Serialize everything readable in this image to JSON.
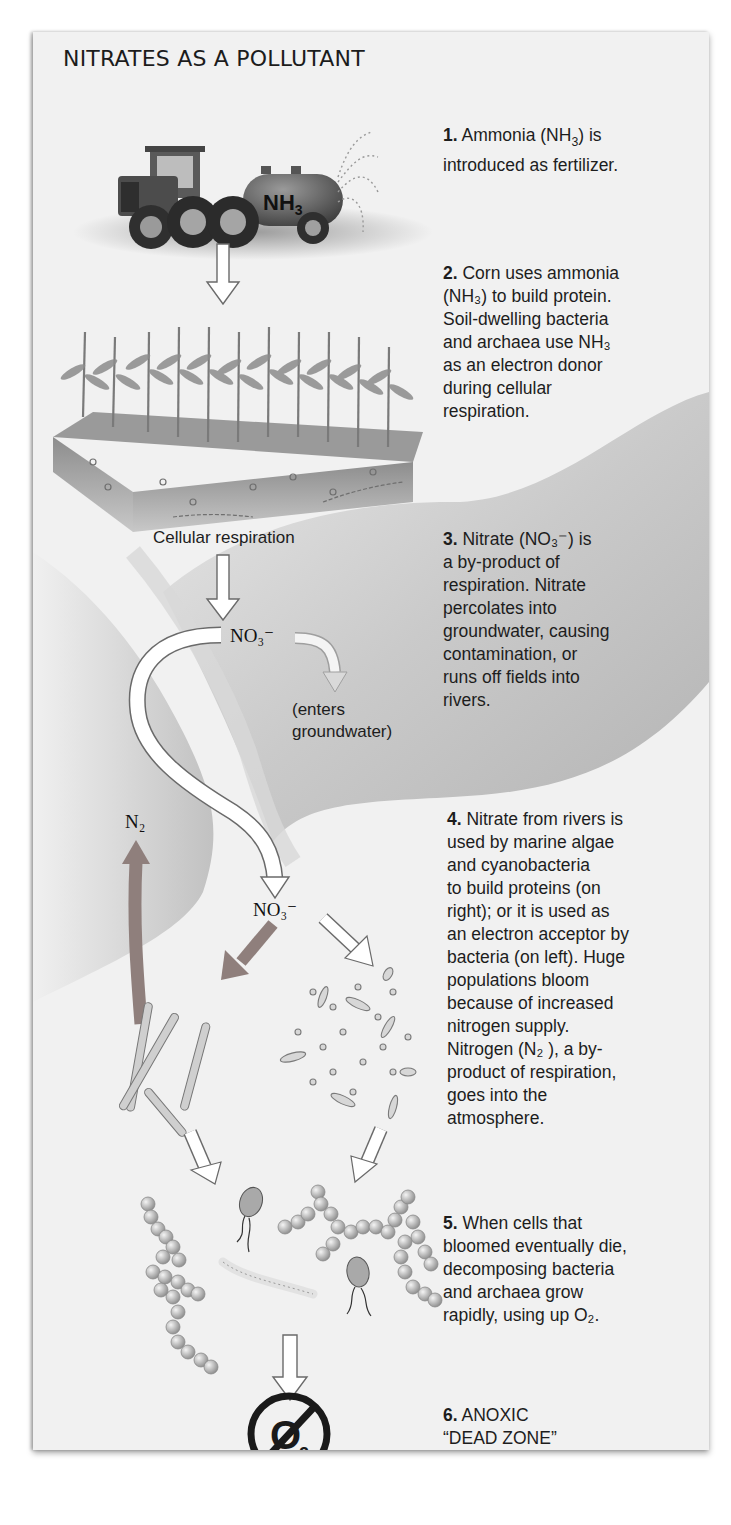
{
  "figure": {
    "title": "NITRATES AS A POLLUTANT",
    "colors": {
      "panel_bg": "#f1f1f1",
      "river_shade": "#b9b9b9",
      "white_arrow": "#ffffff",
      "arrow_outline": "#6a6a6a",
      "n2_arrow": "#8f7f7c",
      "no_o2_symbol": "#1a1a1a"
    }
  },
  "steps": [
    {
      "number": "1.",
      "parts": [
        "Ammonia (NH",
        "3",
        ") is",
        "introduced as fertilizer."
      ]
    },
    {
      "number": "2.",
      "lines": [
        "Corn uses ammonia",
        "(NH₃) to build protein.",
        "Soil-dwelling bacteria",
        "and archaea use NH₃",
        "as an electron donor",
        "during cellular",
        "respiration."
      ]
    },
    {
      "number": "3.",
      "lines": [
        "Nitrate (NO₃⁻) is",
        "a by-product of",
        "respiration. Nitrate",
        "percolates into",
        "groundwater, causing",
        "contamination, or",
        "runs off fields into",
        "rivers."
      ]
    },
    {
      "number": "4.",
      "lines": [
        "Nitrate from rivers is",
        "used by marine algae",
        "and cyanobacteria",
        "to build proteins (on",
        "right); or it is used as",
        "an electron acceptor by",
        "bacteria (on left). Huge",
        "populations bloom",
        "because of increased",
        "nitrogen supply.",
        "Nitrogen (N₂ ), a by-",
        "product of respiration,",
        "goes into the",
        "atmosphere."
      ]
    },
    {
      "number": "5.",
      "lines": [
        "When cells that",
        "bloomed eventually die,",
        "decomposing bacteria",
        "and archaea grow",
        "rapidly, using up O₂."
      ]
    },
    {
      "number": "6.",
      "lines": [
        "ANOXIC",
        "“DEAD ZONE”"
      ]
    }
  ],
  "labels": {
    "tank": "NH₃",
    "cellular_respiration": "Cellular respiration",
    "nitrate_top": "NO₃⁻",
    "enters_groundwater_1": "(enters",
    "enters_groundwater_2": "groundwater)",
    "n2": "N₂",
    "nitrate_river": "NO₃⁻",
    "no_oxygen_symbol": "O₂"
  }
}
